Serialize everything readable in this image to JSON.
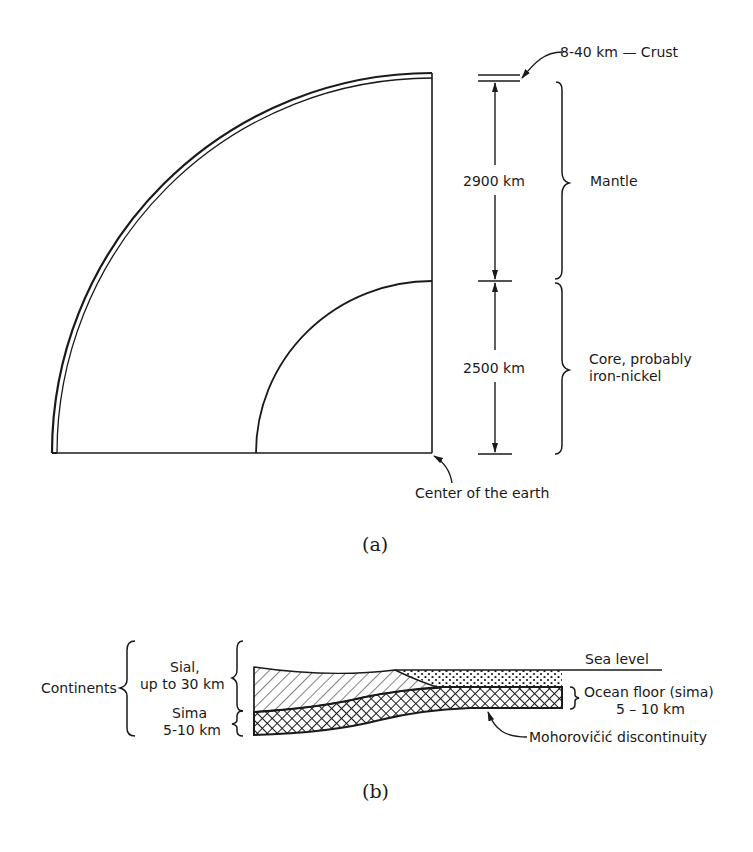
{
  "figure_a": {
    "caption": "(a)",
    "labels": {
      "crust": "8-40 km — Crust",
      "mantle_thickness": "2900 km",
      "mantle": "Mantle",
      "core_thickness": "2500 km",
      "core_line1": "Core, probably",
      "core_line2": "iron-nickel",
      "center": "Center of the earth"
    },
    "layers": [
      {
        "name": "Crust",
        "thickness": "8-40 km"
      },
      {
        "name": "Mantle",
        "thickness": "2900 km"
      },
      {
        "name": "Core, probably iron-nickel",
        "thickness": "2500 km"
      }
    ]
  },
  "figure_b": {
    "caption": "(b)",
    "labels": {
      "continents": "Continents",
      "sial_line1": "Sial,",
      "sial_line2": "up to 30 km",
      "sima_line1": "Sima",
      "sima_line2": "5-10 km",
      "sea_level": "Sea level",
      "ocean_floor_line1": "Ocean floor (sima)",
      "ocean_floor_line2": "5 – 10 km",
      "moho": "Mohorovičić discontinuity"
    }
  },
  "colors": {
    "ink": "#1a1a1a",
    "paper": "#ffffff"
  }
}
